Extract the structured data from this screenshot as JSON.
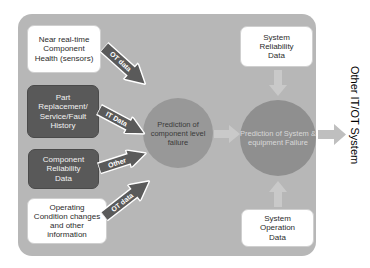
{
  "diagram": {
    "panel": {
      "fill": "#b7b7b7"
    },
    "left_inputs": [
      {
        "id": "near-real-time-component-health",
        "lines": [
          "Near real-time",
          "Component",
          "Health (sensors)"
        ],
        "style": "light"
      },
      {
        "id": "part-replacement-service-fault-history",
        "lines": [
          "Part",
          "Replacement/",
          "Service/Fault",
          "History"
        ],
        "style": "dark"
      },
      {
        "id": "component-reliability-data",
        "lines": [
          "Component",
          "Reliability",
          "Data"
        ],
        "style": "dark"
      },
      {
        "id": "operating-condition-changes",
        "lines": [
          "Operating",
          "Condition changes",
          "and other",
          "information"
        ],
        "style": "light"
      }
    ],
    "right_inputs": [
      {
        "id": "system-reliability-data",
        "lines": [
          "System",
          "Reliability",
          "Data"
        ],
        "style": "light"
      },
      {
        "id": "system-operation-data",
        "lines": [
          "System",
          "Operation",
          "Data"
        ],
        "style": "light"
      }
    ],
    "circles": [
      {
        "id": "prediction-component-level-failure",
        "lines": [
          "Prediction of",
          "component",
          "level failure"
        ],
        "fill": "#989898",
        "text_color": "#3a3a3a"
      },
      {
        "id": "prediction-system-equipment-failure",
        "lines": [
          "Prediction of",
          "System &",
          "equipment",
          "Failure"
        ],
        "fill": "#8f8f8f",
        "text_color": "#d8d8d8"
      }
    ],
    "arrow_labels": {
      "ot_data_top": "OT data",
      "it_data": "IT Data",
      "other": "Other",
      "ot_data_bottom": "OT data"
    },
    "output_caption": "Other IT/OT System",
    "colors": {
      "panel": "#b7b7b7",
      "dark_box": "#595959",
      "light_box": "#ffffff",
      "arrow_dark": "#595959",
      "arrow_light": "#c9c9c9",
      "circle_one": "#989898",
      "circle_two": "#8f8f8f"
    }
  }
}
